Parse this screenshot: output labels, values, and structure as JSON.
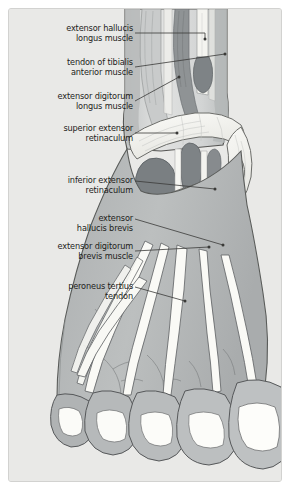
{
  "figure": {
    "frame_bg": "#e9e9e7",
    "frame_border": "#d2d2d0",
    "text_color": "#1d1d1b",
    "leader_color": "#3a3a38"
  },
  "palette": {
    "skin": "#b4b7b8",
    "skin_light": "#c6c8c8",
    "leg_light": "#d8dada",
    "muscle_dark": "#7a7f82",
    "muscle_mid": "#9a9ea0",
    "tendon_white": "#fbfbf9",
    "retinaculum": "#f2f2ee",
    "nail": "#fdfdfb",
    "outline": "#4a4a48",
    "hatch": "#b9bcbc"
  },
  "labels": [
    {
      "id": "extensor-hallucis-longus-muscle",
      "text": "extensor hallucis\nlongus muscle",
      "x": 12,
      "y": 14,
      "w": 112,
      "leader": [
        [
          126,
          24
        ],
        [
          196,
          24
        ],
        [
          196,
          30
        ]
      ]
    },
    {
      "id": "tendon-of-tibialis-anterior-muscle",
      "text": "tendon of tibialis\nanterior muscle",
      "x": 12,
      "y": 48,
      "w": 112,
      "leader": [
        [
          126,
          58
        ],
        [
          216,
          45
        ]
      ]
    },
    {
      "id": "extensor-digitorum-longus-muscle",
      "text": "extensor digitorum\nlongus muscle",
      "x": 12,
      "y": 82,
      "w": 112,
      "leader": [
        [
          126,
          92
        ],
        [
          170,
          68
        ]
      ]
    },
    {
      "id": "superior-extensor-retinaculum",
      "text": "superior extensor\nretinaculum",
      "x": 12,
      "y": 114,
      "w": 112,
      "leader": [
        [
          126,
          124
        ],
        [
          168,
          124
        ]
      ]
    },
    {
      "id": "inferior-extensor-retinaculum",
      "text": "inferior extensor\nretinaculum",
      "x": 12,
      "y": 166,
      "w": 112,
      "leader": [
        [
          126,
          172
        ],
        [
          206,
          180
        ]
      ]
    },
    {
      "id": "extensor-hallucis-brevis",
      "text": "extensor\nhallucis brevis",
      "x": 12,
      "y": 204,
      "w": 112,
      "leader": [
        [
          126,
          210
        ],
        [
          214,
          236
        ]
      ]
    },
    {
      "id": "extensor-digitorum-brevis-muscle",
      "text": "extensor digitorum\nbrevis muscle",
      "x": 12,
      "y": 232,
      "w": 112,
      "leader": [
        [
          126,
          242
        ],
        [
          200,
          238
        ]
      ]
    },
    {
      "id": "peroneus-tertius-tendon",
      "text": "peroneus tertius\ntendon",
      "x": 12,
      "y": 272,
      "w": 112,
      "leader": [
        [
          126,
          278
        ],
        [
          176,
          292
        ]
      ]
    }
  ],
  "toes": [
    {
      "name": "fifth-toe"
    },
    {
      "name": "fourth-toe"
    },
    {
      "name": "third-toe"
    },
    {
      "name": "second-toe"
    },
    {
      "name": "great-toe"
    }
  ]
}
